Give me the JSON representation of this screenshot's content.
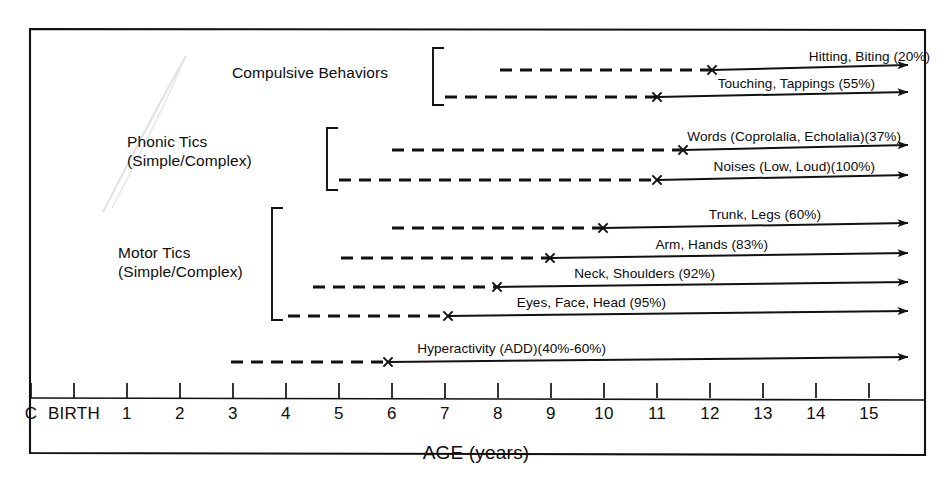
{
  "figure": {
    "axis_title": "AGE (years)",
    "frame_color": "#111111",
    "line_color": "#111111",
    "artifact_color": "#c9c9c9"
  },
  "axis": {
    "ticks": [
      {
        "label": "C",
        "x": 31
      },
      {
        "label": "BIRTH",
        "x": 74
      },
      {
        "label": "1",
        "x": 127
      },
      {
        "label": "2",
        "x": 180
      },
      {
        "label": "3",
        "x": 233
      },
      {
        "label": "4",
        "x": 286
      },
      {
        "label": "5",
        "x": 339
      },
      {
        "label": "6",
        "x": 392
      },
      {
        "label": "7",
        "x": 445
      },
      {
        "label": "8",
        "x": 498
      },
      {
        "label": "9",
        "x": 551
      },
      {
        "label": "10",
        "x": 604
      },
      {
        "label": "11",
        "x": 657
      },
      {
        "label": "12",
        "x": 710
      },
      {
        "label": "13",
        "x": 763
      },
      {
        "label": "14",
        "x": 816
      },
      {
        "label": "15",
        "x": 869
      }
    ]
  },
  "groups": [
    {
      "name": "compulsive-behaviors",
      "label": "Compulsive Behaviors",
      "label_x": 232,
      "label_y": 63,
      "bracket": {
        "x": 433,
        "y_top": 48,
        "y_bottom": 105,
        "tab": 11
      }
    },
    {
      "name": "phonic-tics",
      "label": "Phonic Tics\n(Simple/Complex)",
      "label_x": 127,
      "label_y": 132,
      "bracket": {
        "x": 327,
        "y_top": 128,
        "y_bottom": 190,
        "tab": 11
      }
    },
    {
      "name": "motor-tics",
      "label": "Motor Tics\n(Simple/Complex)",
      "label_x": 118,
      "label_y": 243,
      "bracket": {
        "x": 272,
        "y_top": 208,
        "y_bottom": 320,
        "tab": 11
      }
    }
  ],
  "rows": [
    {
      "name": "hitting-biting",
      "label": "Hitting, Biting (20%)",
      "percent": "20%",
      "group": "compulsive-behaviors",
      "y": 70,
      "dash_start_x": 500,
      "marker_x": 712,
      "arrow_end_x": 908,
      "onset_age": 8.9,
      "marker_age": 12.0
    },
    {
      "name": "touching-tappings",
      "label": "Touching, Tappings (55%)",
      "percent": "55%",
      "group": "compulsive-behaviors",
      "y": 97,
      "dash_start_x": 445,
      "marker_x": 657,
      "arrow_end_x": 908,
      "onset_age": 7.9,
      "marker_age": 11.0
    },
    {
      "name": "words-coprolalia-echolalia",
      "label": "Words (Coprolalia, Echolalia)(37%)",
      "percent": "37%",
      "group": "phonic-tics",
      "y": 150,
      "dash_start_x": 392,
      "marker_x": 683,
      "arrow_end_x": 908,
      "onset_age": 6.0,
      "marker_age": 11.5
    },
    {
      "name": "noises-low-loud",
      "label": "Noises (Low, Loud)(100%)",
      "percent": "100%",
      "group": "phonic-tics",
      "y": 180,
      "dash_start_x": 339,
      "marker_x": 657,
      "arrow_end_x": 908,
      "onset_age": 5.0,
      "marker_age": 11.0
    },
    {
      "name": "trunk-legs",
      "label": "Trunk, Legs (60%)",
      "percent": "60%",
      "group": "motor-tics",
      "y": 228,
      "dash_start_x": 392,
      "marker_x": 603,
      "arrow_end_x": 908,
      "onset_age": 6.0,
      "marker_age": 10.0
    },
    {
      "name": "arm-hands",
      "label": "Arm, Hands (83%)",
      "percent": "83%",
      "group": "motor-tics",
      "y": 258,
      "dash_start_x": 341,
      "marker_x": 550,
      "arrow_end_x": 908,
      "onset_age": 5.0,
      "marker_age": 9.0
    },
    {
      "name": "neck-shoulders",
      "label": "Neck, Shoulders (92%)",
      "percent": "92%",
      "group": "motor-tics",
      "y": 287,
      "dash_start_x": 313,
      "marker_x": 497,
      "arrow_end_x": 908,
      "onset_age": 4.5,
      "marker_age": 8.0
    },
    {
      "name": "eyes-face-head",
      "label": "Eyes, Face, Head (95%)",
      "percent": "95%",
      "group": "motor-tics",
      "y": 316,
      "dash_start_x": 288,
      "marker_x": 448,
      "arrow_end_x": 908,
      "onset_age": 4.0,
      "marker_age": 7.0
    },
    {
      "name": "hyperactivity-add",
      "label": "Hyperactivity (ADD)(40%-60%)",
      "percent": "40%-60%",
      "group": "none",
      "y": 362,
      "dash_start_x": 231,
      "marker_x": 388,
      "arrow_end_x": 908,
      "onset_age": 3.0,
      "marker_age": 6.0
    }
  ],
  "chart_data": {
    "type": "table",
    "xlabel": "AGE (years)",
    "ylabel": "",
    "xlim": [
      0,
      15.7
    ],
    "grid": false,
    "legend": "none",
    "x_tick_labels": [
      "C",
      "BIRTH",
      "1",
      "2",
      "3",
      "4",
      "5",
      "6",
      "7",
      "8",
      "9",
      "10",
      "11",
      "12",
      "13",
      "14",
      "15"
    ],
    "columns": [
      "Symptom",
      "Group",
      "Prevalence",
      "Dashed onset range begins (age)",
      "Peak marker (age)",
      "Arrow continues to"
    ],
    "rows": [
      [
        "Hitting, Biting",
        "Compulsive Behaviors",
        "20%",
        8.9,
        12.0,
        "beyond 15"
      ],
      [
        "Touching, Tappings",
        "Compulsive Behaviors",
        "55%",
        7.9,
        11.0,
        "beyond 15"
      ],
      [
        "Words (Coprolalia, Echolalia)",
        "Phonic Tics (Simple/Complex)",
        "37%",
        6.0,
        11.5,
        "beyond 15"
      ],
      [
        "Noises (Low, Loud)",
        "Phonic Tics (Simple/Complex)",
        "100%",
        5.0,
        11.0,
        "beyond 15"
      ],
      [
        "Trunk, Legs",
        "Motor Tics (Simple/Complex)",
        "60%",
        6.0,
        10.0,
        "beyond 15"
      ],
      [
        "Arm, Hands",
        "Motor Tics (Simple/Complex)",
        "83%",
        5.0,
        9.0,
        "beyond 15"
      ],
      [
        "Neck, Shoulders",
        "Motor Tics (Simple/Complex)",
        "92%",
        4.5,
        8.0,
        "beyond 15"
      ],
      [
        "Eyes, Face, Head",
        "Motor Tics (Simple/Complex)",
        "95%",
        4.0,
        7.0,
        "beyond 15"
      ],
      [
        "Hyperactivity (ADD)",
        "(ungrouped)",
        "40%-60%",
        3.0,
        6.0,
        "beyond 15"
      ]
    ]
  }
}
